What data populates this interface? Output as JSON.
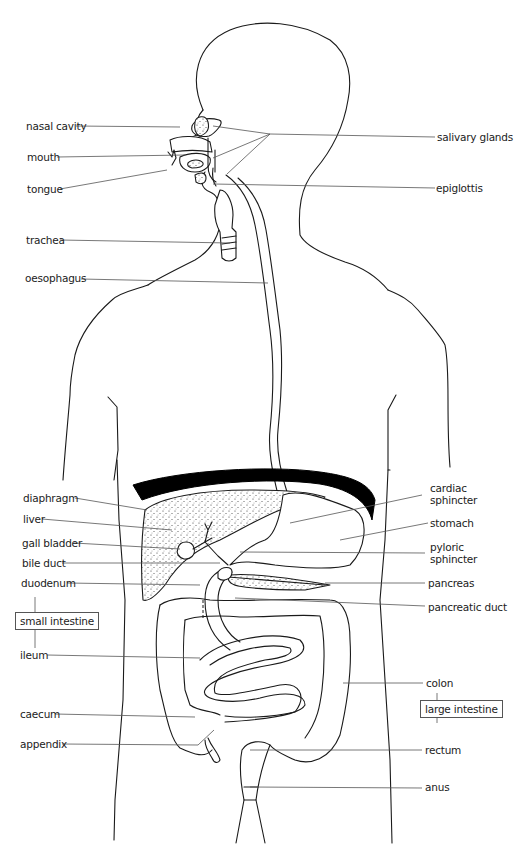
{
  "diagram": {
    "labels_left": [
      {
        "id": "nasal-cavity",
        "text": "nasal cavity"
      },
      {
        "id": "mouth",
        "text": "mouth"
      },
      {
        "id": "tongue",
        "text": "tongue"
      },
      {
        "id": "trachea",
        "text": "trachea"
      },
      {
        "id": "oesophagus",
        "text": "oesophagus"
      },
      {
        "id": "diaphragm",
        "text": "diaphragm"
      },
      {
        "id": "liver",
        "text": "liver"
      },
      {
        "id": "gall-bladder",
        "text": "gall bladder"
      },
      {
        "id": "bile-duct",
        "text": "bile duct"
      },
      {
        "id": "duodenum",
        "text": "duodenum"
      },
      {
        "id": "ileum",
        "text": "ileum"
      },
      {
        "id": "caecum",
        "text": "caecum"
      },
      {
        "id": "appendix",
        "text": "appendix"
      }
    ],
    "labels_right": [
      {
        "id": "salivary-glands",
        "text": "salivary glands"
      },
      {
        "id": "epiglottis",
        "text": "epiglottis"
      },
      {
        "id": "cardiac-sphincter-1",
        "text": "cardiac"
      },
      {
        "id": "cardiac-sphincter-2",
        "text": "sphincter"
      },
      {
        "id": "stomach",
        "text": "stomach"
      },
      {
        "id": "pyloric-sphincter-1",
        "text": "pyloric"
      },
      {
        "id": "pyloric-sphincter-2",
        "text": "sphincter"
      },
      {
        "id": "pancreas",
        "text": "pancreas"
      },
      {
        "id": "pancreatic-duct",
        "text": "pancreatic duct"
      },
      {
        "id": "colon",
        "text": "colon"
      },
      {
        "id": "rectum",
        "text": "rectum"
      },
      {
        "id": "anus",
        "text": "anus"
      }
    ],
    "group_boxes": {
      "small_intestine": "small intestine",
      "large_intestine": "large intestine"
    }
  }
}
